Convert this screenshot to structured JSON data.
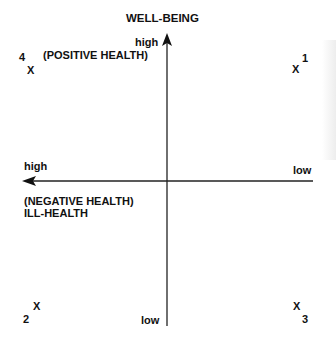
{
  "diagram": {
    "title": "WELL-BEING",
    "vertical_axis": {
      "top_label": "high",
      "top_caption": "(POSITIVE HEALTH)",
      "bottom_label": "low"
    },
    "horizontal_axis": {
      "left_label": "high",
      "left_caption_line1": "(NEGATIVE HEALTH)",
      "left_caption_line2": "ILL-HEALTH",
      "right_label": "low"
    },
    "points": [
      {
        "number": "1",
        "marker": "X",
        "quadrant": "top-right"
      },
      {
        "number": "2",
        "marker": "X",
        "quadrant": "bottom-left"
      },
      {
        "number": "3",
        "marker": "X",
        "quadrant": "bottom-right"
      },
      {
        "number": "4",
        "marker": "X",
        "quadrant": "top-left"
      }
    ],
    "colors": {
      "ink": "#111111",
      "background": "#ffffff"
    }
  }
}
